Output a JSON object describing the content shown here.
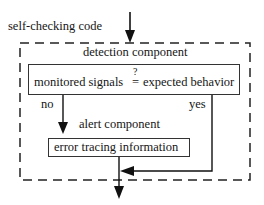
{
  "diagram": {
    "input_label": "self-checking code",
    "container": {
      "style": "dashed",
      "detection_component": {
        "title": "detection component",
        "condition": {
          "left": "monitored signals",
          "operator": "=",
          "operator_mark": "?",
          "right": "expected behavior"
        }
      },
      "branches": {
        "no": "no",
        "yes": "yes"
      },
      "alert_component": {
        "title": "alert component",
        "box_text": "error tracing information"
      }
    },
    "colors": {
      "line": "#111111",
      "background": "#ffffff"
    }
  }
}
